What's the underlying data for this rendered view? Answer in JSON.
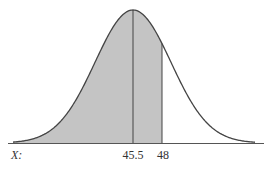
{
  "chart_data": {
    "type": "area",
    "title": "",
    "axis_label": "X:",
    "tick_labels": [
      "45.5",
      "48"
    ],
    "mean": 45.5,
    "shade_upper_bound": 48,
    "shaded_region": "left of 48",
    "grid": false,
    "legend": null
  },
  "colors": {
    "shade": "#c4c4c4",
    "curve": "#444444",
    "axis": "#555555",
    "text": "#333333"
  },
  "labels": {
    "axis": "X:",
    "mean": "45.5",
    "bound": "48"
  }
}
